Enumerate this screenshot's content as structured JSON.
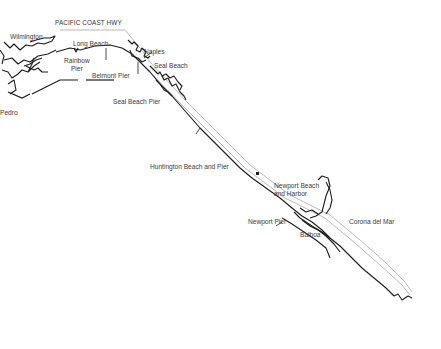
{
  "map": {
    "title": "Southern California coast: Long Beach to Corona del Mar",
    "highway_label": "PACIFIC COAST HWY",
    "colors": {
      "coastline": "#1c1c1c",
      "highway": "#9a9a9a",
      "label": "#3a3a3a",
      "background": "#ffffff"
    },
    "labels": {
      "wilmington": "Wilmington",
      "long_beach": "Long Beach",
      "rainbow_pier": "Rainbow\nPier",
      "belmont_pier": "Belmont Pier",
      "naples": "Naples",
      "seal_beach": "Seal Beach",
      "seal_beach_pier": "Seal Beach Pier",
      "san_pedro": "Pedro",
      "huntington": "Huntington Beach and Pier",
      "newport_beach": "Newport Beach\nand Harbor",
      "newport_pier": "Newport Pier",
      "balboa": "Balboa",
      "corona": "Corona del Mar"
    }
  }
}
